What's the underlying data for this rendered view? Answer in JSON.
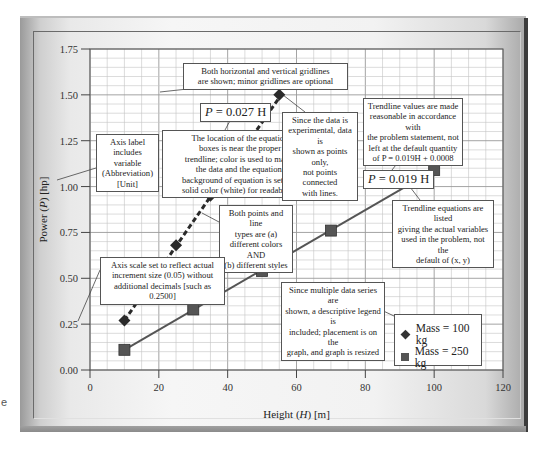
{
  "stray_text": "e",
  "chart_data": {
    "type": "scatter",
    "title": "",
    "xlabel": "Height (H) [m]",
    "ylabel": "Power (P) [hp]",
    "xlim": [
      0,
      120
    ],
    "ylim": [
      0.0,
      1.75
    ],
    "x_ticks": [
      "0",
      "20",
      "40",
      "60",
      "80",
      "100",
      "120"
    ],
    "y_ticks": [
      "0.00",
      "0.25",
      "0.50",
      "0.75",
      "1.00",
      "1.25",
      "1.50",
      "1.75"
    ],
    "grid": {
      "major": true,
      "minor": true,
      "minor_x_step": 5,
      "minor_y_step": 0.05
    },
    "legend_position": "lower right (on graph)",
    "series": [
      {
        "name": "Mass = 100 kg",
        "marker": "diamond",
        "color": "#2a2a2a",
        "line_style": "dashed",
        "x": [
          10,
          15,
          25,
          35,
          55
        ],
        "y": [
          0.27,
          0.41,
          0.68,
          0.95,
          1.5
        ],
        "trendline": {
          "equation": "P = 0.027 H",
          "slope": 0.027,
          "intercept": 0
        }
      },
      {
        "name": "Mass = 250 kg",
        "marker": "square",
        "color": "#555555",
        "line_style": "solid",
        "x": [
          10,
          30,
          50,
          70,
          100
        ],
        "y": [
          0.11,
          0.33,
          0.54,
          0.76,
          1.09
        ],
        "trendline": {
          "equation": "P = 0.019 H",
          "slope": 0.019,
          "intercept": 0
        }
      }
    ],
    "annotations": [
      "Both horizontal and vertical gridlines are shown; minor gridlines are optional",
      "Axis label includes variable (Abbreviation) [Unit]",
      "The location of the equation boxes is near the proper trendline; color is used to match the data and the equation; background of equation is set to a solid color (white) for readability.",
      "Since the data is experimental, data is shown as points only, not points connected with lines.",
      "Trendline values are made reasonable in accordance with the problem statement, not left at the default quantity of P = 0.019H + 0.0008",
      "Trendline equations are listed giving the actual variables used in the problem, not the default of (x, y)",
      "Both points and line types are (a) different colors AND (b) different styles",
      "Axis scale set to reflect actual increment size (0.05) without additional decimals [such as 0.2500]",
      "Since multiple data series are shown, a descriptive legend is included; placement is on the graph, and graph is resized"
    ]
  },
  "axes": {
    "x_title": {
      "pre": "Height (",
      "var": "H",
      "post": ") [m]"
    },
    "y_title": {
      "pre": "Power (",
      "var": "P",
      "post": ") [hp]"
    }
  },
  "equations": {
    "eq100": {
      "var": "P",
      "rest": " = 0.027 H"
    },
    "eq250": {
      "var": "P",
      "rest": " = 0.019 H"
    }
  },
  "notes": {
    "gridlines": [
      "Both horizontal and vertical gridlines",
      "are shown; minor gridlines are optional"
    ],
    "axis_label": [
      "Axis label",
      "includes",
      "variable",
      "(Abbreviation)",
      "[Unit]"
    ],
    "equation_location": [
      "The location of the equation",
      "boxes is near the proper",
      "trendline; color is used to match",
      "the data and the equation;",
      "background of equation is set to a",
      "solid color (white) for readability."
    ],
    "experimental": [
      "Since the data is",
      "experimental, data is",
      "shown as points only,",
      "not points connected",
      "with lines."
    ],
    "trendline_values": [
      "Trendline values are made",
      "reasonable in accordance with",
      "the problem statement, not",
      "left at the default quantity",
      "of P = 0.019H + 0.0008"
    ],
    "trendline_equations": [
      "Trendline equations are listed",
      "giving the actual variables",
      "used in the problem, not the",
      "default of (x, y)"
    ],
    "points_lines": [
      "Both points and line",
      "types are (a)",
      "different colors AND",
      "(b) different styles"
    ],
    "axis_scale": [
      "Axis scale set to reflect actual",
      "increment size (0.05) without",
      "additional decimals [such as 0.2500]"
    ],
    "legend_note": [
      "Since multiple data series are",
      "shown, a descriptive legend is",
      "included; placement is on the",
      "graph, and graph is resized"
    ]
  },
  "legend": {
    "items": [
      {
        "label": "Mass = 100 kg",
        "symbol": "diamond"
      },
      {
        "label": "Mass = 250 kg",
        "symbol": "square"
      }
    ]
  }
}
